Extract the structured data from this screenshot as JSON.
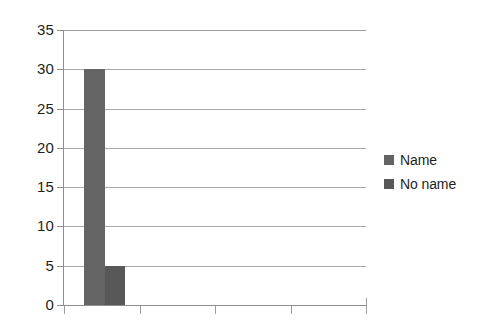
{
  "chart_data": {
    "type": "bar",
    "title": "",
    "subtitle": "",
    "xlabel": "",
    "ylabel": "",
    "categories": [
      "1",
      "2",
      "3",
      "4"
    ],
    "series": [
      {
        "name": "Name",
        "color": "#646464",
        "values": [
          30,
          0,
          0,
          0
        ]
      },
      {
        "name": "No name",
        "color": "#585858",
        "values": [
          5,
          0,
          0,
          0
        ]
      }
    ],
    "ylim": [
      0,
      35
    ],
    "ytick_labels": [
      "0",
      "5",
      "10",
      "15",
      "20",
      "25",
      "30",
      "35"
    ],
    "ytick_values": [
      0,
      5,
      10,
      15,
      20,
      25,
      30,
      35
    ],
    "xtick_labels": [
      "",
      "",
      "",
      ""
    ],
    "grid": true,
    "grid_axis": "y",
    "legend_position": "right",
    "legend": [
      {
        "label": "Name",
        "color": "#646464"
      },
      {
        "label": "No name",
        "color": "#585858"
      }
    ],
    "background_color": "#ffffff",
    "axis_color": "#8e8e8e",
    "gridline_color": "#9a9a9a",
    "text_color": "#231f20"
  }
}
